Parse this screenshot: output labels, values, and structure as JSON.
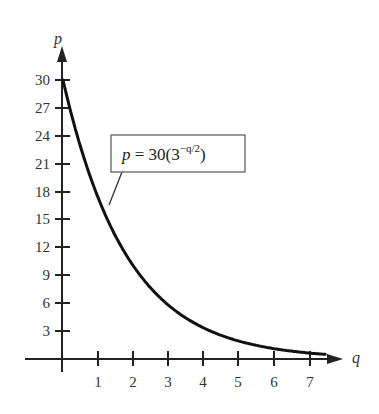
{
  "chart_data": {
    "type": "line",
    "title": "",
    "xlabel": "q",
    "ylabel": "p",
    "x_ticks": [
      1,
      2,
      3,
      4,
      5,
      6,
      7
    ],
    "y_ticks": [
      3,
      6,
      9,
      12,
      15,
      18,
      21,
      24,
      27,
      30
    ],
    "xlim": [
      0,
      7.7
    ],
    "ylim": [
      0,
      32
    ],
    "grid": false,
    "series": [
      {
        "name": "p = 30(3^(-q/2))",
        "formula": "p = 30*3^(-q/2)",
        "x": [
          0,
          0.5,
          1,
          1.5,
          2,
          2.5,
          3,
          3.5,
          4,
          4.5,
          5,
          5.5,
          6,
          6.5,
          7,
          7.5
        ],
        "values": [
          30,
          22.8,
          17.32,
          13.16,
          10,
          7.6,
          5.77,
          4.39,
          3.33,
          2.53,
          1.92,
          1.46,
          1.11,
          0.84,
          0.64,
          0.49
        ]
      }
    ],
    "annotation": {
      "text_main": "p = 30(3",
      "text_sup": "−q/2",
      "text_close": ")"
    }
  },
  "axes": {
    "x_label": "q",
    "y_label": "p",
    "x_tick_labels": [
      "1",
      "2",
      "3",
      "4",
      "5",
      "6",
      "7"
    ],
    "y_tick_labels": [
      "3",
      "6",
      "9",
      "12",
      "15",
      "18",
      "21",
      "24",
      "27",
      "30"
    ]
  },
  "colors": {
    "curve": "#111111",
    "axis": "#222222",
    "text": "#333333",
    "box_border": "#555555"
  }
}
